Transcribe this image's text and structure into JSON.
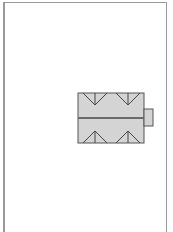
{
  "diagram": {
    "type": "roof-plan",
    "colors": {
      "paper": "#ffffff",
      "frame": "#9a9a9a",
      "roof_fill": "#d4d4d4",
      "roof_stroke": "#555555",
      "ridge": "#6a6a6a"
    },
    "building": {
      "main": {
        "x": 78,
        "y": 93,
        "width": 66,
        "height": 50
      },
      "ridge_y": 118,
      "annex": {
        "x": 144,
        "y": 109,
        "width": 9,
        "height": 17
      },
      "top_valleys": [
        {
          "apex_x": 95
        },
        {
          "apex_x": 128
        }
      ],
      "bottom_valleys": [
        {
          "apex_x": 95
        },
        {
          "apex_x": 128
        }
      ]
    }
  }
}
